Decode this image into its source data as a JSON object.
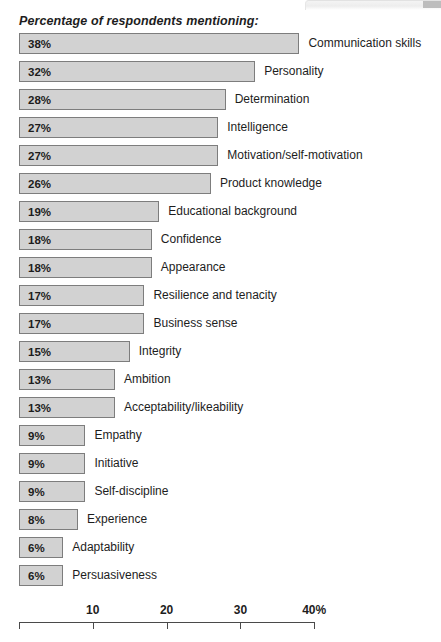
{
  "chart_data": {
    "type": "bar",
    "orientation": "horizontal",
    "title": "Percentage of respondents mentioning:",
    "xlabel": "",
    "ylabel": "",
    "xlim": [
      0,
      40
    ],
    "grid": false,
    "legend": null,
    "axis": {
      "ticks": [
        0,
        10,
        20,
        30,
        40
      ],
      "tick_labels": [
        "",
        "10",
        "20",
        "30",
        "40%"
      ],
      "unit": "%"
    },
    "value_label_suffix": "%",
    "categories": [
      "Communication skills",
      "Personality",
      "Determination",
      "Intelligence",
      "Motivation/self-motivation",
      "Product knowledge",
      "Educational background",
      "Confidence",
      "Appearance",
      "Resilience and tenacity",
      "Business sense",
      "Integrity",
      "Ambition",
      "Acceptability/likeability",
      "Empathy",
      "Initiative",
      "Self-discipline",
      "Experience",
      "Adaptability",
      "Persuasiveness"
    ],
    "values": [
      38,
      32,
      28,
      27,
      27,
      26,
      19,
      18,
      18,
      17,
      17,
      15,
      13,
      13,
      9,
      9,
      9,
      8,
      6,
      6
    ],
    "value_labels": [
      "38%",
      "32%",
      "28%",
      "27%",
      "27%",
      "26%",
      "19%",
      "18%",
      "18%",
      "17%",
      "17%",
      "15%",
      "13%",
      "13%",
      "9%",
      "9%",
      "9%",
      "8%",
      "6%",
      "6%"
    ],
    "bars": [
      {
        "label": "Communication skills",
        "value": 38,
        "value_label": "38%"
      },
      {
        "label": "Personality",
        "value": 32,
        "value_label": "32%"
      },
      {
        "label": "Determination",
        "value": 28,
        "value_label": "28%"
      },
      {
        "label": "Intelligence",
        "value": 27,
        "value_label": "27%"
      },
      {
        "label": "Motivation/self-motivation",
        "value": 27,
        "value_label": "27%"
      },
      {
        "label": "Product knowledge",
        "value": 26,
        "value_label": "26%"
      },
      {
        "label": "Educational background",
        "value": 19,
        "value_label": "19%"
      },
      {
        "label": "Confidence",
        "value": 18,
        "value_label": "18%"
      },
      {
        "label": "Appearance",
        "value": 18,
        "value_label": "18%"
      },
      {
        "label": "Resilience and tenacity",
        "value": 17,
        "value_label": "17%"
      },
      {
        "label": "Business sense",
        "value": 17,
        "value_label": "17%"
      },
      {
        "label": "Integrity",
        "value": 15,
        "value_label": "15%"
      },
      {
        "label": "Ambition",
        "value": 13,
        "value_label": "13%"
      },
      {
        "label": "Acceptability/likeability",
        "value": 13,
        "value_label": "13%"
      },
      {
        "label": "Empathy",
        "value": 9,
        "value_label": "9%"
      },
      {
        "label": "Initiative",
        "value": 9,
        "value_label": "9%"
      },
      {
        "label": "Self-discipline",
        "value": 9,
        "value_label": "9%"
      },
      {
        "label": "Experience",
        "value": 8,
        "value_label": "8%"
      },
      {
        "label": "Adaptability",
        "value": 6,
        "value_label": "6%"
      },
      {
        "label": "Persuasiveness",
        "value": 6,
        "value_label": "6%"
      }
    ],
    "colors": {
      "bar_fill": "#d2d2d2",
      "bar_border": "#7d7d7d",
      "text": "#1d1d1d",
      "axis": "#4a4a4a",
      "background": "#ffffff"
    }
  }
}
